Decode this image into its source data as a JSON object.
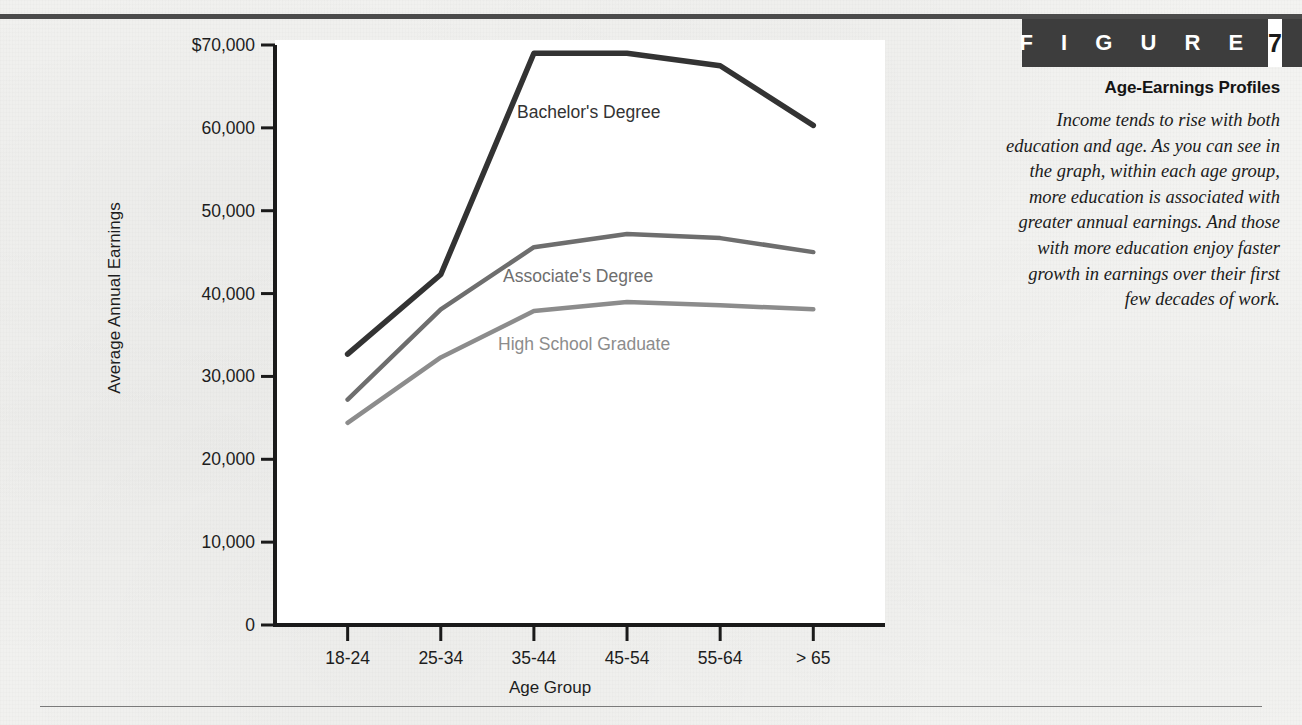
{
  "figure": {
    "banner_word": "F I G U R E",
    "banner_number": "7",
    "title": "Age-Earnings Profiles",
    "caption": "Income tends to rise with both education and age. As you can see in the graph, within each age group, more education is associated with greater annual earnings. And those with more education enjoy faster growth in earnings over their first few decades of work.",
    "banner_color": "#3d3d3d",
    "banner_text_color": "#ffffff"
  },
  "chart_data": {
    "type": "line",
    "title": "Age-Earnings Profiles",
    "xlabel": "Age Group",
    "ylabel": "Average Annual Earnings",
    "categories": [
      "18-24",
      "25-34",
      "35-44",
      "45-54",
      "55-64",
      "> 65"
    ],
    "ylim": [
      0,
      70000
    ],
    "yticks": [
      0,
      10000,
      20000,
      30000,
      40000,
      50000,
      60000,
      70000
    ],
    "ytick_labels": [
      "0",
      "10,000",
      "20,000",
      "30,000",
      "40,000",
      "50,000",
      "60,000",
      "$70,000"
    ],
    "grid": false,
    "legend": "inline-labels",
    "series": [
      {
        "name": "Bachelor's Degree",
        "color": "#333333",
        "values": [
          32700,
          42300,
          69000,
          69000,
          67500,
          60300
        ],
        "label_x": 457,
        "label_y": 74
      },
      {
        "name": "Associate's Degree",
        "color": "#6e6e6e",
        "values": [
          27200,
          38100,
          45600,
          47200,
          46700,
          45000
        ],
        "label_x": 443,
        "label_y": 238
      },
      {
        "name": "High School Graduate",
        "color": "#8c8c8c",
        "values": [
          24400,
          32300,
          37900,
          39000,
          38600,
          38100
        ],
        "label_x": 438,
        "label_y": 306
      }
    ]
  }
}
